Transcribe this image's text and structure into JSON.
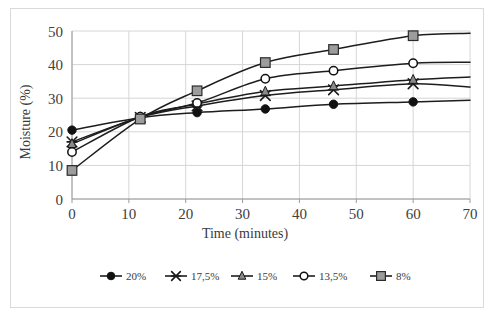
{
  "chart_data": {
    "type": "line",
    "title": "",
    "xlabel": "Time (minutes)",
    "ylabel": "Moisture (%)",
    "xlim": [
      0,
      70
    ],
    "ylim": [
      0,
      50
    ],
    "xticks": [
      0,
      10,
      20,
      30,
      40,
      50,
      60,
      70
    ],
    "yticks": [
      0,
      10,
      20,
      30,
      40,
      50
    ],
    "xtick_labels": [
      "0",
      "10",
      "20",
      "30",
      "40",
      "50",
      "60",
      "70"
    ],
    "ytick_labels": [
      "0",
      "10",
      "20",
      "30",
      "40",
      "50"
    ],
    "grid": "horizontal-and-vertical",
    "legend_position": "bottom",
    "x": [
      0,
      12,
      22,
      34,
      46,
      60,
      70
    ],
    "series": [
      {
        "name": "20%",
        "marker": "filled-circle",
        "color": "#1a1a1a",
        "values": [
          20.5,
          24.2,
          25.7,
          26.8,
          28.2,
          28.9,
          29.4
        ],
        "last_marker_index": 5
      },
      {
        "name": "17,5%",
        "marker": "cross-x",
        "color": "#2b2b2b",
        "values": [
          17.0,
          24.3,
          27.7,
          30.8,
          32.5,
          34.3,
          33.3
        ],
        "last_marker_index": 5
      },
      {
        "name": "15%",
        "marker": "triangle",
        "color": "#6e6e6e",
        "values": [
          16.4,
          24.4,
          28.3,
          32.0,
          33.6,
          35.5,
          36.3
        ],
        "last_marker_index": 5
      },
      {
        "name": "13,5%",
        "marker": "open-circle",
        "color": "#1a1a1a",
        "values": [
          14.0,
          24.5,
          28.6,
          35.8,
          38.2,
          40.4,
          40.7
        ],
        "last_marker_index": 5
      },
      {
        "name": "8%",
        "marker": "filled-square",
        "color": "#8c8c8c",
        "values": [
          8.5,
          23.8,
          32.2,
          40.6,
          44.5,
          48.6,
          49.3
        ],
        "last_marker_index": 5
      }
    ]
  },
  "legend": {
    "items": [
      {
        "label": "20%"
      },
      {
        "label": "17,5%"
      },
      {
        "label": "15%"
      },
      {
        "label": "13,5%"
      },
      {
        "label": "8%"
      }
    ]
  }
}
